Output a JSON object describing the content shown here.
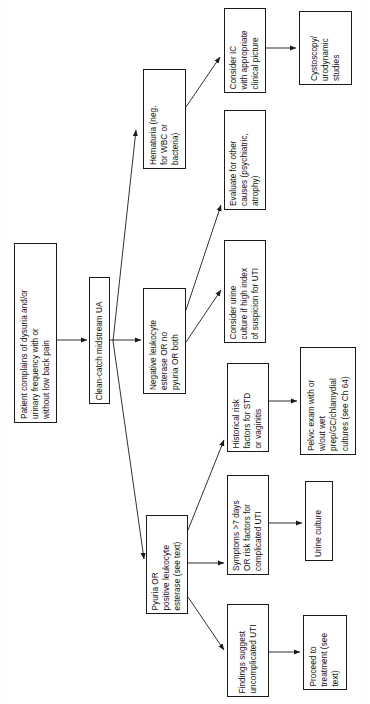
{
  "diagram": {
    "orientation": "rotated-90-ccw",
    "line_color": "#1a1a1a",
    "box_fill": "#ffffff",
    "nodes": [
      {
        "id": "presentation",
        "label": "Patient complains of dysuria and/or urinary frequency with or without low back pain",
        "lines": [
          "Patient complains of dysuria and/or",
          "urinary frequency with or",
          "without low back pain"
        ],
        "x": 14,
        "y": 243,
        "w": 43,
        "h": 180
      },
      {
        "id": "clean-catch-ua",
        "label": "Clean-catch midstream UA",
        "lines": [
          "Clean-catch midstream UA"
        ],
        "x": 89,
        "y": 277,
        "w": 21,
        "h": 127
      },
      {
        "id": "hematuria",
        "label": "Hematuria (neg. for WBC or bacteria)",
        "lines": [
          "Hematuria (neg.",
          "for WBC or",
          "bacteria)"
        ],
        "x": 143,
        "y": 69,
        "w": 43,
        "h": 100
      },
      {
        "id": "negative-leukocyte-esterase",
        "label": "Negative leukocyte esterase OR no pyuria OR both",
        "lines": [
          "Negative leukocyte",
          "esterase OR no",
          "pyuria OR both"
        ],
        "x": 143,
        "y": 288,
        "w": 43,
        "h": 106
      },
      {
        "id": "pyuria-positive-leukocyte-esterase",
        "label": "Pyuria OR positive leukocyte esterase (see text)",
        "lines": [
          "Pyuria OR",
          "positive leukocyte",
          "esterase (see text)"
        ],
        "x": 146,
        "y": 515,
        "w": 42,
        "h": 99
      },
      {
        "id": "consider-ic",
        "label": "Consider IC with appropriate clinical picture",
        "lines": [
          "Consider IC",
          "with appropriate",
          "clinical picture"
        ],
        "x": 224,
        "y": 8,
        "w": 42,
        "h": 85
      },
      {
        "id": "evaluate-other-causes",
        "label": "Evaluate for other causes (psychiatric, atrophy)",
        "lines": [
          "Evaluate for other",
          "causes (psychiatric,",
          "atrophy)"
        ],
        "x": 224,
        "y": 110,
        "w": 42,
        "h": 100
      },
      {
        "id": "consider-urine-culture",
        "label": "Consider urine culture if high index of suspicion for UTI",
        "lines": [
          "Consider urine",
          "culture if high index",
          "of suspicion for UTI"
        ],
        "x": 224,
        "y": 240,
        "w": 42,
        "h": 103
      },
      {
        "id": "historical-risk-factors",
        "label": "Historical risk factors for STD or vaginitis",
        "lines": [
          "Historical risk",
          "factors for STD",
          "or vaginitis"
        ],
        "x": 227,
        "y": 363,
        "w": 42,
        "h": 89
      },
      {
        "id": "symptoms-7-days",
        "label": "Symptoms >7 days OR risk factors for complicated UTI",
        "lines": [
          "Symptoms >7 days",
          "OR risk factors for",
          "complicated UTI"
        ],
        "x": 227,
        "y": 475,
        "w": 42,
        "h": 100
      },
      {
        "id": "findings-uncomplicated-uti",
        "label": "Findings suggest uncomplicated UTI",
        "lines": [
          "Findings suggest",
          "uncomplicated UTI"
        ],
        "x": 227,
        "y": 604,
        "w": 42,
        "h": 93
      },
      {
        "id": "cystoscopy-urodynamic",
        "label": "Cystoscopy/urodynamic studies",
        "lines": [
          "Cystoscopy/",
          "urodynamic",
          "studies"
        ],
        "x": 299,
        "y": 11,
        "w": 53,
        "h": 74
      },
      {
        "id": "pelvic-exam",
        "label": "Pelvic exam with or w/out wet prep/GC/chlamydial cultures (see Ch 64)",
        "lines": [
          "Pelvic exam with or",
          "w/out wet",
          "prep/GC/chlamydial",
          "cultures (see Ch 64)"
        ],
        "x": 300,
        "y": 347,
        "w": 56,
        "h": 108
      },
      {
        "id": "urine-culture",
        "label": "Urine culture",
        "lines": [
          "Urine culture"
        ],
        "x": 305,
        "y": 481,
        "w": 28,
        "h": 80
      },
      {
        "id": "proceed-to-treatment",
        "label": "Proceed to treatment (see text)",
        "lines": [
          "Proceed to",
          "treatment (see",
          "text)"
        ],
        "x": 303,
        "y": 615,
        "w": 44,
        "h": 75
      }
    ],
    "edges": [
      {
        "from": "presentation",
        "to": "clean-catch-ua"
      },
      {
        "from": "clean-catch-ua",
        "to": "hematuria"
      },
      {
        "from": "clean-catch-ua",
        "to": "negative-leukocyte-esterase"
      },
      {
        "from": "clean-catch-ua",
        "to": "pyuria-positive-leukocyte-esterase"
      },
      {
        "from": "hematuria",
        "to": "consider-ic"
      },
      {
        "from": "consider-ic",
        "to": "cystoscopy-urodynamic"
      },
      {
        "from": "negative-leukocyte-esterase",
        "to": "evaluate-other-causes"
      },
      {
        "from": "negative-leukocyte-esterase",
        "to": "consider-urine-culture"
      },
      {
        "from": "pyuria-positive-leukocyte-esterase",
        "to": "historical-risk-factors"
      },
      {
        "from": "pyuria-positive-leukocyte-esterase",
        "to": "symptoms-7-days"
      },
      {
        "from": "pyuria-positive-leukocyte-esterase",
        "to": "findings-uncomplicated-uti"
      },
      {
        "from": "historical-risk-factors",
        "to": "pelvic-exam"
      },
      {
        "from": "symptoms-7-days",
        "to": "urine-culture"
      },
      {
        "from": "findings-uncomplicated-uti",
        "to": "proceed-to-treatment"
      }
    ]
  }
}
